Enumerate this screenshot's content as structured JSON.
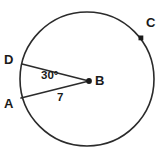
{
  "figure": {
    "type": "circle-geometry-diagram",
    "background_color": "#ffffff",
    "stroke_color": "#2b2b2b",
    "text_color": "#1a1a1a"
  },
  "circle": {
    "name": "circle-B",
    "center_x": 87,
    "center_y": 79,
    "radius": 67,
    "stroke_width": 1.6,
    "fill": "none"
  },
  "points": [
    {
      "id": "D",
      "label": "D",
      "x": 22,
      "y": 64,
      "marker": "none",
      "label_position": "left"
    },
    {
      "id": "A",
      "label": "A",
      "x": 21,
      "y": 98,
      "marker": "none",
      "label_position": "left"
    },
    {
      "id": "B",
      "label": "B",
      "x": 89,
      "y": 81,
      "marker": "dot",
      "label_position": "right"
    },
    {
      "id": "C",
      "label": "C",
      "x": 141,
      "y": 38,
      "marker": "square",
      "label_position": "upper-right"
    }
  ],
  "segments": [
    {
      "name": "radius-BD",
      "from": "B",
      "to": "D"
    },
    {
      "name": "radius-BA",
      "from": "B",
      "to": "A"
    }
  ],
  "labels": {
    "point_d": "D",
    "point_a": "A",
    "point_b": "B",
    "point_c": "C",
    "angle_measure": "30°",
    "radius_measure": "7"
  }
}
